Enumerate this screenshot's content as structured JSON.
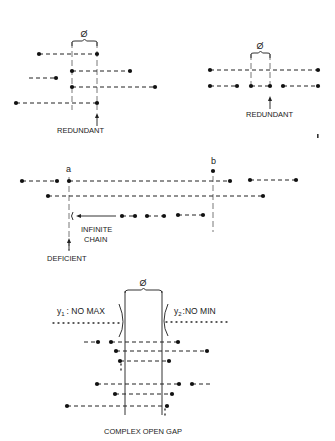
{
  "panels": {
    "redundant_left": {
      "label": "REDUNDANT",
      "gap_symbol": "Ø",
      "verticals_x": [
        72,
        97
      ],
      "brace": {
        "x1": 72,
        "x2": 97,
        "y": 42
      },
      "symbol_pos": [
        84,
        37
      ],
      "label_pos": [
        57,
        133
      ],
      "arrow": {
        "x": 97,
        "y1": 126,
        "y2": 113
      },
      "segments": [
        {
          "x1": 39,
          "x2": 97,
          "y": 54,
          "dots": [
            39,
            97
          ]
        },
        {
          "x1": 72,
          "x2": 130,
          "y": 71,
          "dots": [
            72,
            130
          ]
        },
        {
          "x1": 29,
          "x2": 56,
          "y": 78,
          "dots": [
            56
          ]
        },
        {
          "x1": 72,
          "x2": 155,
          "y": 87,
          "dots": [
            72,
            155
          ]
        },
        {
          "x1": 16,
          "x2": 97,
          "y": 103,
          "dots": [
            16,
            97
          ]
        }
      ]
    },
    "redundant_right": {
      "label": "REDUNDANT",
      "gap_symbol": "Ø",
      "verticals_x": [
        251,
        270
      ],
      "brace": {
        "x1": 251,
        "x2": 270,
        "y": 54
      },
      "symbol_pos": [
        260,
        49
      ],
      "label_pos": [
        246,
        117
      ],
      "arrow": {
        "x": 270,
        "y1": 109,
        "y2": 96
      },
      "segments": [
        {
          "x1": 210,
          "x2": 318,
          "y": 70,
          "dots": [
            210,
            318
          ]
        },
        {
          "x1": 210,
          "x2": 237,
          "y": 86,
          "dots": [
            210,
            237
          ]
        },
        {
          "x1": 251,
          "x2": 270,
          "y": 86,
          "dots": [
            251,
            270
          ]
        },
        {
          "x1": 283,
          "x2": 318,
          "y": 86,
          "dots": [
            283,
            318
          ]
        }
      ],
      "stray_mark": [
        317,
        137
      ]
    },
    "deficient": {
      "label_a": "a",
      "label_b": "b",
      "label_a_pos": [
        66,
        172
      ],
      "label_b_pos": [
        211,
        164
      ],
      "vertical_a": {
        "x": 69,
        "y1": 177,
        "y2": 250
      },
      "vertical_b": {
        "x": 213,
        "y1": 176,
        "y2": 232
      },
      "b_point": [
        213,
        171
      ],
      "segments": [
        {
          "x1": 22,
          "x2": 57,
          "y": 181,
          "dots": [
            22,
            57
          ]
        },
        {
          "x1": 69,
          "x2": 230,
          "y": 181,
          "dots": [
            69,
            230
          ]
        },
        {
          "x1": 250,
          "x2": 296,
          "y": 180,
          "dots": [
            250,
            296
          ]
        },
        {
          "x1": 48,
          "x2": 263,
          "y": 196,
          "dots": [
            48,
            263
          ]
        },
        {
          "x1": 122,
          "x2": 135,
          "y": 216,
          "dots": [
            122,
            135
          ]
        },
        {
          "x1": 147,
          "x2": 164,
          "y": 216,
          "dots": [
            147,
            164
          ]
        },
        {
          "x1": 178,
          "x2": 203,
          "y": 215,
          "dots": [
            178,
            203
          ]
        }
      ],
      "chain_label_1": "INFINITE",
      "chain_label_2": "CHAIN",
      "chain_label_pos": [
        81,
        232
      ],
      "chain_arrow": {
        "x1": 116,
        "x2": 76,
        "y": 216
      },
      "paren_pos": [
        71,
        219
      ],
      "deficient_label": "DEFICIENT",
      "deficient_label_pos": [
        47,
        261
      ],
      "deficient_arrow": {
        "x": 69,
        "y1": 251,
        "y2": 238
      }
    },
    "complex_open_gap": {
      "label": "COMPLEX OPEN GAP",
      "label_pos": [
        104,
        434
      ],
      "gap_symbol": "Ø",
      "symbol_pos": [
        143,
        286
      ],
      "verticals_x": [
        125,
        162
      ],
      "verticals_y": [
        291,
        415
      ],
      "y1_label": "y",
      "y1_sub": "1",
      "y1_text": ": NO MAX",
      "y1_pos": [
        57,
        314
      ],
      "y2_label": "y",
      "y2_sub": "2",
      "y2_text": ":NO MIN",
      "y2_pos": [
        174,
        314
      ],
      "dotted_left": {
        "x1": 53,
        "x2": 123,
        "y": 323
      },
      "dotted_right": {
        "x1": 166,
        "x2": 230,
        "y": 322
      },
      "segments": [
        {
          "x1": 84,
          "x2": 98,
          "y": 342,
          "dots": [
            98
          ]
        },
        {
          "x1": 111,
          "x2": 178,
          "y": 342,
          "dots": [
            111,
            178
          ]
        },
        {
          "x1": 116,
          "x2": 207,
          "y": 351,
          "dots": [
            116,
            207
          ]
        },
        {
          "x1": 120,
          "x2": 169,
          "y": 361,
          "dots": [
            120,
            169
          ]
        },
        {
          "x1": 97,
          "x2": 179,
          "y": 384,
          "dots": [
            97,
            179
          ]
        },
        {
          "x1": 192,
          "x2": 210,
          "y": 384,
          "dots": [
            192
          ]
        },
        {
          "x1": 115,
          "x2": 172,
          "y": 394,
          "dots": [
            115,
            172
          ]
        },
        {
          "x1": 67,
          "x2": 167,
          "y": 406,
          "dots": [
            67,
            167
          ]
        }
      ],
      "trail_dots": [
        {
          "x": 121,
          "y1": 364,
          "y2": 373
        },
        {
          "x": 165,
          "y1": 409,
          "y2": 419
        }
      ]
    }
  }
}
